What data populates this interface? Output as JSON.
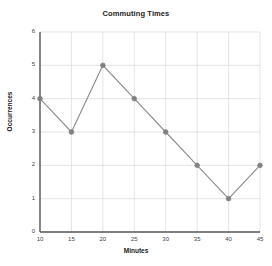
{
  "chart_data": {
    "type": "line",
    "title": "Commuting Times",
    "xlabel": "Minutes",
    "ylabel": "Occurrences",
    "x": [
      10,
      15,
      20,
      25,
      30,
      35,
      40,
      45
    ],
    "values": [
      4,
      3,
      5,
      4,
      3,
      2,
      1,
      2
    ],
    "series": [
      {
        "name": "Occurrences",
        "values": [
          4,
          3,
          5,
          4,
          3,
          2,
          1,
          2
        ]
      }
    ],
    "xlim": [
      10,
      45
    ],
    "ylim": [
      0,
      6
    ],
    "xticks": [
      10,
      15,
      20,
      25,
      30,
      35,
      40,
      45
    ],
    "yticks": [
      0,
      1,
      2,
      3,
      4,
      5,
      6
    ],
    "xtick_labels": [
      "10",
      "15",
      "20",
      "25",
      "30",
      "35",
      "40",
      "45"
    ],
    "ytick_labels": [
      "0",
      "1",
      "2",
      "3",
      "4",
      "5",
      "6"
    ],
    "grid": true,
    "legend": false,
    "marker": "circle",
    "line_color": "#8c8c8c",
    "marker_color": "#808080",
    "grid_color": "#d9d9d9",
    "axis_color": "#595959",
    "background_color": "#ffffff"
  }
}
